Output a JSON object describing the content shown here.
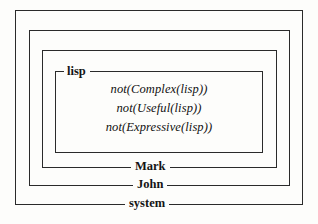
{
  "figure": {
    "type": "nested-context-diagram",
    "background_color": "#fdfdfb",
    "line_color": "#2a2a2a",
    "text_color": "#141414"
  },
  "contexts": [
    {
      "id": "system",
      "label": "system",
      "label_position": "bottom-center",
      "depth": 0
    },
    {
      "id": "john",
      "label": "John",
      "label_position": "bottom-center",
      "depth": 1
    },
    {
      "id": "mark",
      "label": "Mark",
      "label_position": "bottom-center",
      "depth": 2
    },
    {
      "id": "lisp",
      "label": "lisp",
      "label_position": "top-left",
      "depth": 3
    }
  ],
  "formulas": [
    {
      "text": "not(Complex(lisp))"
    },
    {
      "text": "not(Useful(lisp))"
    },
    {
      "text": "not(Expressive(lisp))"
    }
  ]
}
